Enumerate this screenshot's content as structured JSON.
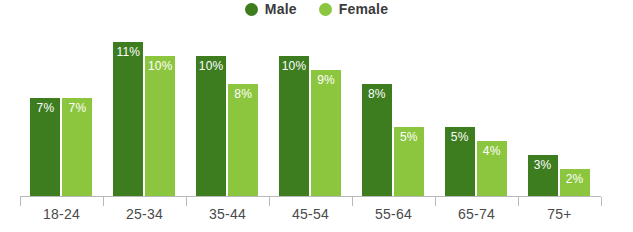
{
  "chart_data": {
    "type": "bar",
    "title": "",
    "subtitle": "",
    "xlabel": "",
    "ylabel": "",
    "categories": [
      "18-24",
      "25-34",
      "35-44",
      "45-54",
      "55-64",
      "65-74",
      "75+"
    ],
    "series": [
      {
        "name": "Male",
        "color": "#3d7c1f",
        "values": [
          7,
          11,
          10,
          10,
          8,
          5,
          3
        ],
        "labels": [
          "7%",
          "11%",
          "10%",
          "10%",
          "8%",
          "5%",
          "3%"
        ]
      },
      {
        "name": "Female",
        "color": "#8cc63e",
        "values": [
          7,
          10,
          8,
          9,
          5,
          4,
          2
        ],
        "labels": [
          "7%",
          "10%",
          "8%",
          "9%",
          "5%",
          "4%",
          "2%"
        ]
      }
    ],
    "ylim": [
      0,
      12
    ],
    "grid": false,
    "legend_position": "top-center",
    "value_label_position": "inside-top",
    "value_label_color": "#ffffff",
    "axis_color": "#b9b9b9"
  },
  "legend": {
    "items": [
      {
        "label": "Male",
        "color": "#3d7c1f",
        "marker": "circle-icon"
      },
      {
        "label": "Female",
        "color": "#8cc63e",
        "marker": "circle-icon"
      }
    ]
  }
}
